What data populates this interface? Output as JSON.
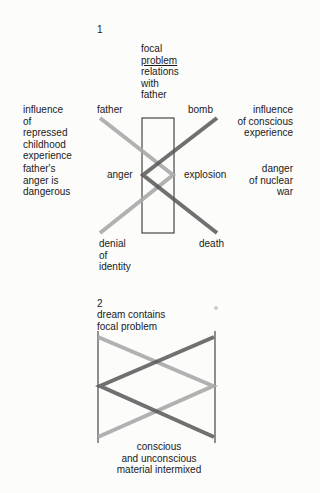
{
  "figure1": {
    "number": "1",
    "focal_title": "focal",
    "focal_underlined": "problem",
    "focal_subtitle": "relations\nwith\nfather",
    "left_top": "influence\nof\nrepressed\nchildhood\nexperience",
    "left_bottom": "father's\nanger is\ndangerous",
    "right_top": "influence\nof conscious\nexperience",
    "right_bottom": "danger\nof nuclear\nwar",
    "node_father": "father",
    "node_bomb": "bomb",
    "node_anger": "anger",
    "node_explosion": "explosion",
    "node_denial": "denial\nof\nidentity",
    "node_death": "death"
  },
  "figure2": {
    "number": "2",
    "title": "dream contains\nfocal problem",
    "caption": "conscious\nand unconscious\nmaterial intermixed"
  },
  "colors": {
    "light_line": "#a9a9a9",
    "dark_line": "#575757",
    "frame": "#222222"
  }
}
